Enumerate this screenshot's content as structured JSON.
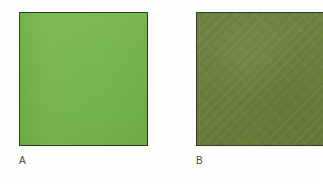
{
  "figure": {
    "kind": "color-swatch-comparison",
    "background_color": "#fdfdfb",
    "width": 320,
    "height": 184
  },
  "swatches": [
    {
      "id": "a",
      "label": "A",
      "fill_color": "#74b44a",
      "border_color": "#2e3b28",
      "surface": "smooth",
      "x": 19,
      "y": 12,
      "width": 129,
      "height": 134,
      "cropped": false
    },
    {
      "id": "b",
      "label": "B",
      "fill_color": "#6b7f3a",
      "border_color": "#2e3b28",
      "surface": "textured-diagonal",
      "x": 196,
      "y": 12,
      "width": 127,
      "height": 134,
      "cropped": true
    }
  ]
}
